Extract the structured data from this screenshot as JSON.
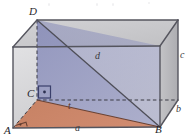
{
  "figure": {
    "type": "rectangular-prism-diagonal",
    "vertices": [
      {
        "name": "A",
        "label": "A",
        "x": 13,
        "y": 128,
        "position": "front-bottom-left"
      },
      {
        "name": "B",
        "label": "B",
        "x": 160,
        "y": 127,
        "position": "front-bottom-right"
      },
      {
        "name": "C",
        "label": "C",
        "x": 37,
        "y": 100,
        "position": "back-bottom-left"
      },
      {
        "name": "D",
        "label": "D",
        "x": 37,
        "y": 20,
        "position": "back-top-left"
      }
    ],
    "edge_labels": [
      {
        "name": "a",
        "label": "a",
        "x": 78,
        "y": 126,
        "edge": "A-B bottom front width"
      },
      {
        "name": "b",
        "label": "b",
        "x": 179,
        "y": 108,
        "edge": "B-back depth"
      },
      {
        "name": "c",
        "label": "c",
        "x": 182,
        "y": 53,
        "edge": "right vertical height"
      },
      {
        "name": "d",
        "label": "d",
        "x": 97,
        "y": 55,
        "edge": "D-B space diagonal"
      },
      {
        "name": "t",
        "label": "t",
        "x": 70,
        "y": 105,
        "edge": "C-B base diagonal"
      }
    ],
    "colors": {
      "box_fill_front": "#d8d8da",
      "box_fill_top": "#c9c9cb",
      "box_fill_right": "#b9b9bb",
      "diagonal_plane": "#8f92bd",
      "base_triangle": "#c9795a",
      "edge_stroke": "#5a5a62",
      "hidden_stroke": "#3d3d45",
      "label_color": "#2b2b30"
    },
    "right_angle_markers": [
      {
        "name": "right-angle-at-C",
        "at": "C"
      },
      {
        "name": "right-angle-at-A",
        "at": "A"
      }
    ]
  }
}
